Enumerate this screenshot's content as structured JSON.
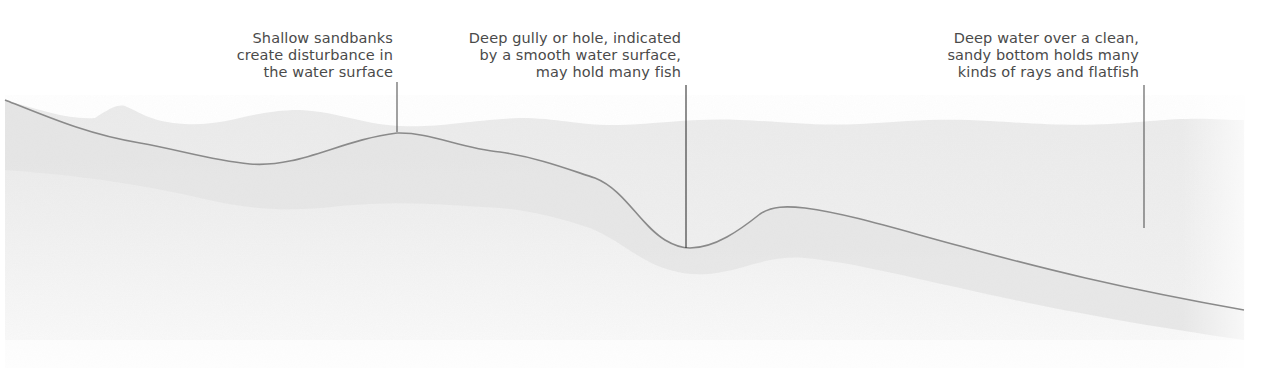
{
  "diagram": {
    "title": "",
    "colors": {
      "background": "#ffffff",
      "water": "#ececec",
      "water_light": "#f3f3f3",
      "seabed_deep": "#e6e6e6",
      "seabed_fade": "#f7f7f7",
      "seabed_line": "#8a8a8a",
      "leader_line": "#444444",
      "text": "#4a4a4a"
    },
    "annotations": [
      {
        "id": "sandbanks",
        "lines": [
          "Shallow sandbanks",
          "create disturbance in",
          "the water surface"
        ],
        "pointer_x": 397,
        "pointer_top": 82,
        "pointer_bottom": 132
      },
      {
        "id": "gully",
        "lines": [
          "Deep gully or hole, indicated",
          "by a smooth water surface,",
          "may hold many fish"
        ],
        "pointer_x": 686,
        "pointer_top": 85,
        "pointer_bottom": 248
      },
      {
        "id": "deep-water",
        "lines": [
          "Deep water over a clean,",
          "sandy bottom holds many",
          "kinds of rays and flatfish"
        ],
        "pointer_x": 1144,
        "pointer_top": 85,
        "pointer_bottom": 228
      }
    ]
  }
}
